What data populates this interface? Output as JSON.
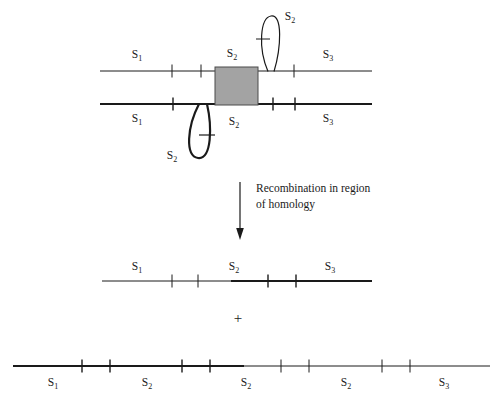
{
  "figure": {
    "title_hidden": "",
    "colors": {
      "line": "#1a1a1a",
      "homology_box_fill": "#a3a3a3",
      "homology_box_stroke": "#4a4a4a",
      "background": "#ffffff"
    },
    "process_label": {
      "line1": "Recombination in region",
      "line2": "of homology"
    },
    "plus": "+",
    "segments": {
      "s1": "S",
      "s1_sub": "1",
      "s2": "S",
      "s2_sub": "2",
      "s3": "S",
      "s3_sub": "3"
    },
    "top_chromosome": {
      "name": "upper-chromosome",
      "labels": [
        {
          "base": "S",
          "sub": "1",
          "x": 137,
          "y": 58
        },
        {
          "base": "S",
          "sub": "2",
          "x": 231,
          "y": 57
        },
        {
          "base": "S",
          "sub": "3",
          "x": 326,
          "y": 58
        }
      ],
      "loop_label": {
        "base": "S",
        "sub": "2",
        "x": 289,
        "y": 20
      }
    },
    "bottom_chromosome": {
      "name": "lower-chromosome",
      "labels": [
        {
          "base": "S",
          "sub": "1",
          "x": 137,
          "y": 120
        },
        {
          "base": "S",
          "sub": "2",
          "x": 231,
          "y": 123
        },
        {
          "base": "S",
          "sub": "3",
          "x": 326,
          "y": 120
        }
      ],
      "loop_label": {
        "base": "S",
        "sub": "2",
        "x": 171,
        "y": 157
      }
    },
    "product_one": {
      "name": "recombinant-product-1",
      "labels": [
        {
          "base": "S",
          "sub": "1",
          "x": 137,
          "y": 268
        },
        {
          "base": "S",
          "sub": "2",
          "x": 233,
          "y": 268
        },
        {
          "base": "S",
          "sub": "3",
          "x": 329,
          "y": 268
        }
      ]
    },
    "product_two": {
      "name": "recombinant-product-2",
      "labels": [
        {
          "base": "S",
          "sub": "1",
          "x": 53,
          "y": 384
        },
        {
          "base": "S",
          "sub": "2",
          "x": 147,
          "y": 384
        },
        {
          "base": "S",
          "sub": "2",
          "x": 245,
          "y": 384
        },
        {
          "base": "S",
          "sub": "2",
          "x": 345,
          "y": 384
        },
        {
          "base": "S",
          "sub": "3",
          "x": 443,
          "y": 384
        }
      ]
    }
  }
}
